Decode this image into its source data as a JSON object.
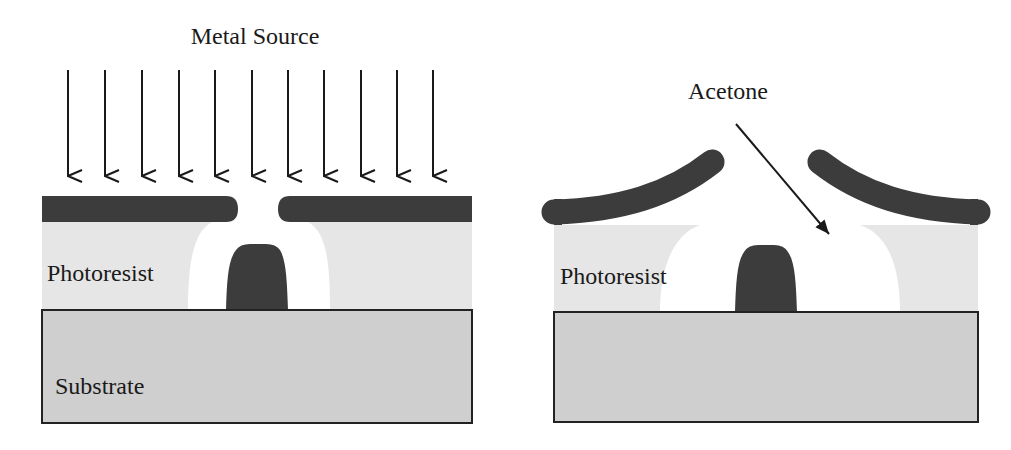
{
  "figure": {
    "left_panel": {
      "title": "Metal Source",
      "labels": {
        "photoresist": "Photoresist",
        "substrate": "Substrate"
      },
      "arrow_count": 11
    },
    "right_panel": {
      "labels": {
        "acetone": "Acetone",
        "photoresist": "Photoresist"
      }
    }
  },
  "colors": {
    "metal": "#3c3c3c",
    "photoresist": "#e6e6e6",
    "substrate": "#cfcfcf",
    "outline": "#222222",
    "background": "#ffffff"
  }
}
